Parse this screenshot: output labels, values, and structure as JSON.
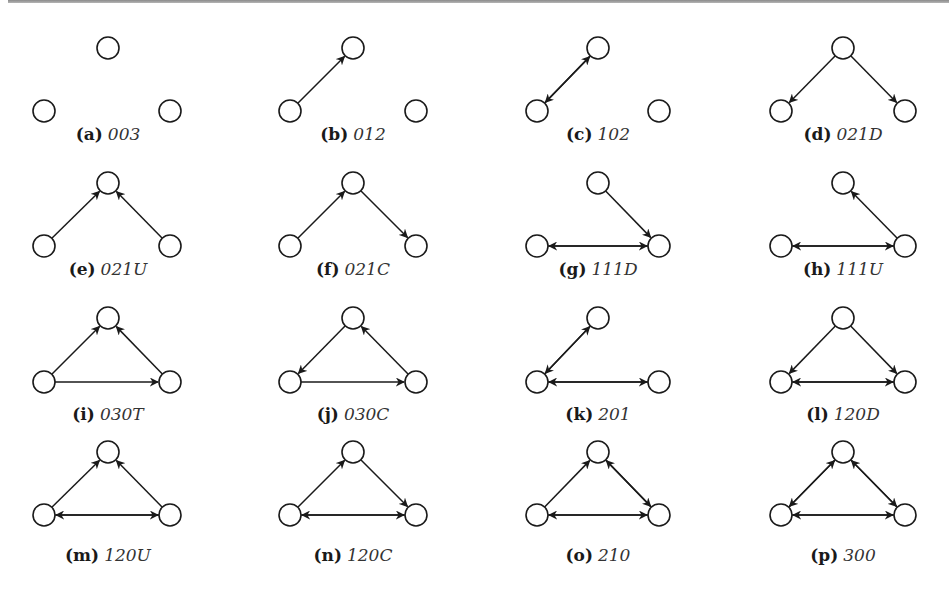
{
  "figure": {
    "node_radius": 11,
    "stroke_color": "#1a1a1a",
    "panels": [
      {
        "letter": "(a)",
        "code": "003",
        "col": 0,
        "row": 0,
        "edges": []
      },
      {
        "letter": "(b)",
        "code": "012",
        "col": 1,
        "row": 0,
        "edges": [
          [
            "L",
            "T"
          ]
        ]
      },
      {
        "letter": "(c)",
        "code": "102",
        "col": 2,
        "row": 0,
        "edges": [
          [
            "L",
            "T"
          ],
          [
            "T",
            "L"
          ]
        ]
      },
      {
        "letter": "(d)",
        "code": "021D",
        "col": 3,
        "row": 0,
        "edges": [
          [
            "T",
            "L"
          ],
          [
            "T",
            "R"
          ]
        ]
      },
      {
        "letter": "(e)",
        "code": "021U",
        "col": 0,
        "row": 1,
        "edges": [
          [
            "L",
            "T"
          ],
          [
            "R",
            "T"
          ]
        ]
      },
      {
        "letter": "(f)",
        "code": "021C",
        "col": 1,
        "row": 1,
        "edges": [
          [
            "L",
            "T"
          ],
          [
            "T",
            "R"
          ]
        ]
      },
      {
        "letter": "(g)",
        "code": "111D",
        "col": 2,
        "row": 1,
        "edges": [
          [
            "T",
            "R"
          ],
          [
            "L",
            "R"
          ],
          [
            "R",
            "L"
          ]
        ]
      },
      {
        "letter": "(h)",
        "code": "111U",
        "col": 3,
        "row": 1,
        "edges": [
          [
            "R",
            "T"
          ],
          [
            "L",
            "R"
          ],
          [
            "R",
            "L"
          ]
        ]
      },
      {
        "letter": "(i)",
        "code": "030T",
        "col": 0,
        "row": 2,
        "edges": [
          [
            "L",
            "T"
          ],
          [
            "R",
            "T"
          ],
          [
            "L",
            "R"
          ]
        ]
      },
      {
        "letter": "(j)",
        "code": "030C",
        "col": 1,
        "row": 2,
        "edges": [
          [
            "T",
            "L"
          ],
          [
            "R",
            "T"
          ],
          [
            "L",
            "R"
          ]
        ]
      },
      {
        "letter": "(k)",
        "code": "201",
        "col": 2,
        "row": 2,
        "edges": [
          [
            "L",
            "T"
          ],
          [
            "T",
            "L"
          ],
          [
            "L",
            "R"
          ],
          [
            "R",
            "L"
          ]
        ]
      },
      {
        "letter": "(l)",
        "code": "120D",
        "col": 3,
        "row": 2,
        "edges": [
          [
            "T",
            "L"
          ],
          [
            "T",
            "R"
          ],
          [
            "L",
            "R"
          ],
          [
            "R",
            "L"
          ]
        ]
      },
      {
        "letter": "(m)",
        "code": "120U",
        "col": 0,
        "row": 3,
        "edges": [
          [
            "L",
            "T"
          ],
          [
            "R",
            "T"
          ],
          [
            "L",
            "R"
          ],
          [
            "R",
            "L"
          ]
        ]
      },
      {
        "letter": "(n)",
        "code": "120C",
        "col": 1,
        "row": 3,
        "edges": [
          [
            "L",
            "T"
          ],
          [
            "T",
            "R"
          ],
          [
            "L",
            "R"
          ],
          [
            "R",
            "L"
          ]
        ]
      },
      {
        "letter": "(o)",
        "code": "210",
        "col": 2,
        "row": 3,
        "edges": [
          [
            "L",
            "T"
          ],
          [
            "T",
            "R"
          ],
          [
            "R",
            "T"
          ],
          [
            "L",
            "R"
          ],
          [
            "R",
            "L"
          ]
        ]
      },
      {
        "letter": "(p)",
        "code": "300",
        "col": 3,
        "row": 3,
        "edges": [
          [
            "L",
            "T"
          ],
          [
            "T",
            "L"
          ],
          [
            "T",
            "R"
          ],
          [
            "R",
            "T"
          ],
          [
            "L",
            "R"
          ],
          [
            "R",
            "L"
          ]
        ]
      }
    ]
  }
}
